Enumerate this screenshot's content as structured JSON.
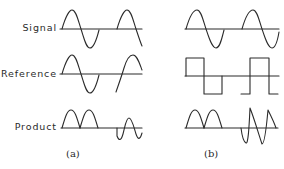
{
  "figure": {
    "row_labels": [
      "Signal",
      "Reference",
      "Product"
    ],
    "panels": [
      {
        "caption": "(a)",
        "rows": [
          {
            "name": "Signal",
            "waveform": "sine",
            "description": "two sine cycles"
          },
          {
            "name": "Reference",
            "waveform": "sine",
            "description": "sine in phase for first cycle, shifted for second"
          },
          {
            "name": "Product",
            "waveform": "rectified-sine",
            "description": "two positive half-wave humps, then oscillation about zero"
          }
        ]
      },
      {
        "caption": "(b)",
        "rows": [
          {
            "name": "Signal",
            "waveform": "sine",
            "description": "two sine cycles"
          },
          {
            "name": "Reference",
            "waveform": "square",
            "description": "square wave in phase for first cycle, shifted for second"
          },
          {
            "name": "Product",
            "waveform": "rectified-sine",
            "description": "two positive humps, then alternating sawtooth-like segments"
          }
        ]
      }
    ],
    "colors": {
      "line": "#2b2b2b",
      "background": "#ffffff",
      "text": "#2a2a2a"
    }
  }
}
